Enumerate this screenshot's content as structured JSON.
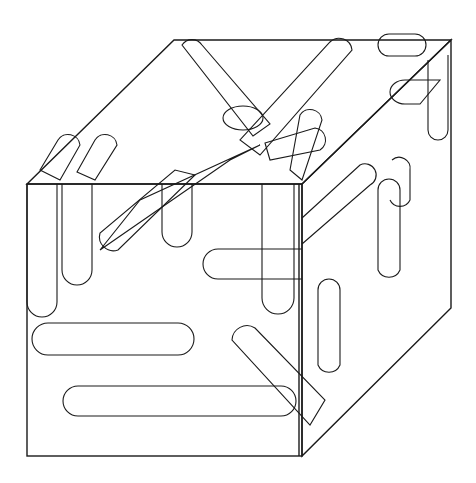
{
  "caption": "8.  barbas",
  "puzzle": {
    "type": "word-search-cube",
    "front_face": {
      "rows": [
        [
          "S",
          "G",
          "D",
          "L",
          "U",
          "C",
          "R",
          "T"
        ],
        [
          "I",
          "A",
          "C",
          "N",
          "C",
          "L",
          "B",
          "U"
        ],
        [
          "H",
          "S",
          "L",
          "Q",
          "V",
          "T",
          "O",
          "R"
        ],
        [
          "C",
          "L",
          "G",
          "M",
          "E",
          "N",
          "A",
          "A"
        ],
        [
          "M",
          "I",
          "G",
          "A",
          "S",
          "C",
          "B",
          "P"
        ],
        [
          "M",
          "D",
          "T",
          "O",
          "M",
          "G",
          "L",
          "O"
        ],
        [
          "L",
          "A",
          "N",
          "Z",
          "U",
          "E",
          "L",
          "O"
        ],
        [
          "P",
          "D",
          "N",
          "V",
          "M",
          "O",
          "M",
          "N"
        ]
      ]
    },
    "top_face": {
      "rows": [
        [
          "T",
          "L",
          "O",
          "D",
          "B",
          "B",
          "T",
          "R"
        ],
        [
          "I",
          "R",
          "S",
          "I",
          "G",
          "A",
          "H",
          "H"
        ],
        [
          "A",
          "M",
          "A",
          "L",
          "I",
          "R",
          "A",
          "D"
        ],
        [
          "P",
          "C",
          "T",
          "P",
          "M",
          "B",
          "S",
          "B"
        ],
        [
          "E",
          "V",
          "I",
          "R",
          "O",
          "A",
          "C",
          "E"
        ],
        [
          "S",
          "P",
          "G",
          "T",
          "R",
          "S",
          "O",
          "P"
        ],
        [
          "A",
          "U",
          "E",
          "A",
          "T",
          "V",
          "S",
          "I"
        ],
        [
          "P",
          "L",
          "A",
          "N",
          "A",
          "U",
          "L",
          "N"
        ]
      ]
    },
    "right_face": {
      "columns": [
        [
          "A",
          "R",
          "N",
          "L",
          "O",
          "D",
          "C",
          "P"
        ],
        [
          "I",
          "L",
          "I",
          "O",
          "V",
          "I",
          "D",
          "A"
        ],
        [
          "V",
          "L",
          "L",
          "G",
          "E",
          "N",
          "O",
          "M"
        ],
        [
          "M",
          "S",
          "L",
          "T",
          "V",
          "X",
          "G",
          "F"
        ],
        [
          "O",
          "O",
          "O",
          "P",
          "A",
          "P",
          "A",
          "Y"
        ],
        [
          "O",
          "D",
          "O",
          "S",
          "B",
          "O",
          "L",
          "D"
        ],
        [
          "B",
          "R",
          "A",
          "C",
          "T",
          "D",
          "E",
          "M"
        ],
        [
          "G",
          "A",
          "G",
          "O",
          "F",
          "Q",
          "L",
          "H"
        ]
      ]
    },
    "found_words_front": [
      "MIGAS",
      "ANZUELO",
      "TOR",
      "GAS",
      "UC"
    ]
  }
}
